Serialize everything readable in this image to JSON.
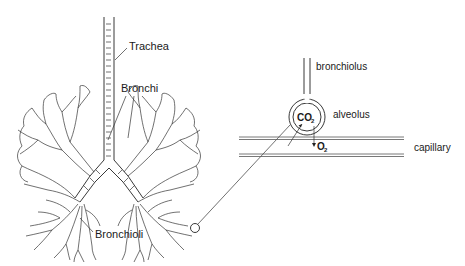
{
  "diagram": {
    "lungs": {
      "labels": {
        "trachea": "Trachea",
        "bronchi": "Bronchi",
        "bronchioli": "Bronchioli"
      }
    },
    "detail": {
      "labels": {
        "bronchiolus": "bronchiolus",
        "alveolus": "alveolus",
        "capillary": "capillary"
      },
      "gases": {
        "co2": {
          "symbol": "CO",
          "subscript": "2"
        },
        "o2": {
          "symbol": "O",
          "subscript": "2"
        }
      }
    },
    "colors": {
      "line": "#222222",
      "background": "#ffffff",
      "capillary": "#555555"
    }
  }
}
